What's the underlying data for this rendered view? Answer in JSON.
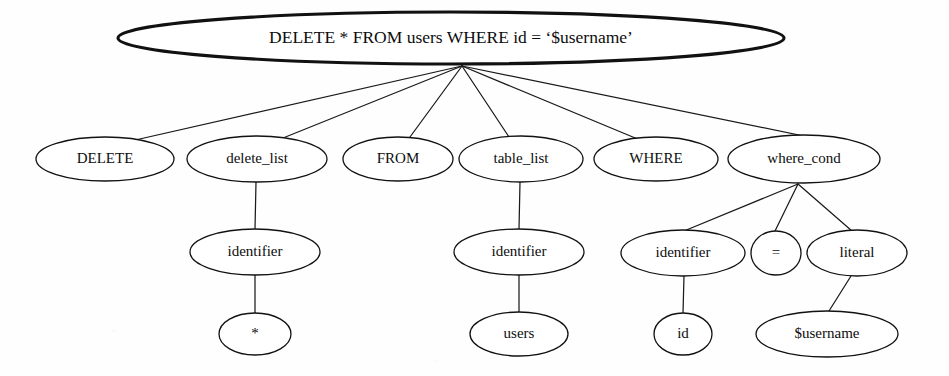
{
  "diagram": {
    "type": "parse-tree",
    "background_color": "#fefefe",
    "stroke_color": "#111111",
    "canvas": {
      "width": 949,
      "height": 376
    },
    "nodes": [
      {
        "id": "root",
        "label": "DELETE * FROM users WHERE id = ‘$username’",
        "cx": 451,
        "cy": 38,
        "rx": 333,
        "ry": 26,
        "emphasis": "bold",
        "level": 0
      },
      {
        "id": "delete_kw",
        "label": "DELETE",
        "cx": 105,
        "cy": 159,
        "rx": 69,
        "ry": 22,
        "emphasis": "normal",
        "level": 1
      },
      {
        "id": "delete_list",
        "label": "delete_list",
        "cx": 257,
        "cy": 159,
        "rx": 70,
        "ry": 23,
        "emphasis": "normal",
        "level": 1
      },
      {
        "id": "from_kw",
        "label": "FROM",
        "cx": 398,
        "cy": 159,
        "rx": 55,
        "ry": 22,
        "emphasis": "normal",
        "level": 1
      },
      {
        "id": "table_list",
        "label": "table_list",
        "cx": 521,
        "cy": 159,
        "rx": 62,
        "ry": 23,
        "emphasis": "normal",
        "level": 1
      },
      {
        "id": "where_kw",
        "label": "WHERE",
        "cx": 656,
        "cy": 159,
        "rx": 62,
        "ry": 22,
        "emphasis": "normal",
        "level": 1
      },
      {
        "id": "where_cond",
        "label": "where_cond",
        "cx": 804,
        "cy": 159,
        "rx": 76,
        "ry": 24,
        "emphasis": "normal",
        "level": 1
      },
      {
        "id": "ident_1",
        "label": "identifier",
        "cx": 255,
        "cy": 252,
        "rx": 65,
        "ry": 23,
        "emphasis": "normal",
        "level": 2
      },
      {
        "id": "ident_2",
        "label": "identifier",
        "cx": 519,
        "cy": 252,
        "rx": 65,
        "ry": 23,
        "emphasis": "normal",
        "level": 2
      },
      {
        "id": "ident_3",
        "label": "identifier",
        "cx": 683,
        "cy": 253,
        "rx": 62,
        "ry": 23,
        "emphasis": "normal",
        "level": 2
      },
      {
        "id": "eq_op",
        "label": "=",
        "cx": 776,
        "cy": 253,
        "rx": 25,
        "ry": 22,
        "emphasis": "normal",
        "level": 2
      },
      {
        "id": "literal",
        "label": "literal",
        "cx": 857,
        "cy": 253,
        "rx": 50,
        "ry": 23,
        "emphasis": "normal",
        "level": 2
      },
      {
        "id": "star",
        "label": "*",
        "cx": 255,
        "cy": 334,
        "rx": 36,
        "ry": 21,
        "emphasis": "normal",
        "level": 3
      },
      {
        "id": "users",
        "label": "users",
        "cx": 519,
        "cy": 334,
        "rx": 49,
        "ry": 22,
        "emphasis": "normal",
        "level": 3
      },
      {
        "id": "id_leaf",
        "label": "id",
        "cx": 683,
        "cy": 334,
        "rx": 29,
        "ry": 21,
        "emphasis": "normal",
        "level": 3
      },
      {
        "id": "username",
        "label": "$username",
        "cx": 827,
        "cy": 334,
        "rx": 71,
        "ry": 23,
        "emphasis": "normal",
        "level": 3
      }
    ],
    "edges": [
      {
        "from": "root",
        "to": "delete_kw",
        "x1": 462,
        "y1": 66,
        "x2": 122,
        "y2": 143
      },
      {
        "from": "root",
        "to": "delete_list",
        "x1": 462,
        "y1": 66,
        "x2": 283,
        "y2": 138
      },
      {
        "from": "root",
        "to": "from_kw",
        "x1": 462,
        "y1": 66,
        "x2": 410,
        "y2": 137
      },
      {
        "from": "root",
        "to": "table_list",
        "x1": 462,
        "y1": 66,
        "x2": 509,
        "y2": 137
      },
      {
        "from": "root",
        "to": "where_kw",
        "x1": 462,
        "y1": 66,
        "x2": 640,
        "y2": 140
      },
      {
        "from": "root",
        "to": "where_cond",
        "x1": 462,
        "y1": 66,
        "x2": 828,
        "y2": 141
      },
      {
        "from": "delete_list",
        "to": "ident_1",
        "x1": 256,
        "y1": 182,
        "x2": 255,
        "y2": 229
      },
      {
        "from": "table_list",
        "to": "ident_2",
        "x1": 520,
        "y1": 182,
        "x2": 519,
        "y2": 229
      },
      {
        "from": "where_cond",
        "to": "ident_3",
        "x1": 798,
        "y1": 184,
        "x2": 684,
        "y2": 231
      },
      {
        "from": "where_cond",
        "to": "eq_op",
        "x1": 798,
        "y1": 184,
        "x2": 775,
        "y2": 231
      },
      {
        "from": "where_cond",
        "to": "literal",
        "x1": 798,
        "y1": 184,
        "x2": 852,
        "y2": 231
      },
      {
        "from": "ident_1",
        "to": "star",
        "x1": 255,
        "y1": 275,
        "x2": 255,
        "y2": 313
      },
      {
        "from": "ident_2",
        "to": "users",
        "x1": 519,
        "y1": 275,
        "x2": 519,
        "y2": 312
      },
      {
        "from": "ident_3",
        "to": "id_leaf",
        "x1": 684,
        "y1": 276,
        "x2": 683,
        "y2": 313
      },
      {
        "from": "literal",
        "to": "username",
        "x1": 851,
        "y1": 276,
        "x2": 829,
        "y2": 311
      }
    ]
  }
}
